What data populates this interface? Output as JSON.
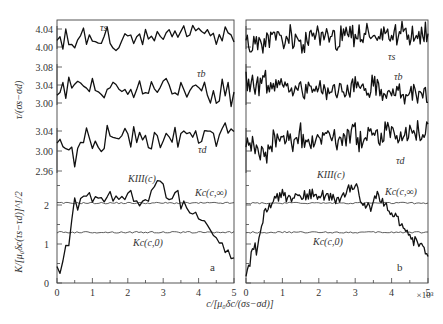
{
  "chart_data": {
    "type": "line",
    "title": "",
    "xlabel": "c/[μ0δc/(σs−σd)]",
    "x_multiplier": "×10³",
    "xticks": [
      0,
      1,
      2,
      3,
      4,
      5
    ],
    "xlim": [
      0,
      5
    ],
    "upper_ylabel": "τ/(σs−σd)",
    "lower_ylabel": "K/[μ0δc(τs−τd)]^1/2",
    "upper_subpanels": [
      {
        "name": "τs",
        "label": "τ_s",
        "yticks": [
          4.0,
          4.04
        ],
        "ylim": [
          3.98,
          4.05
        ]
      },
      {
        "name": "τb",
        "label": "τ_b",
        "yticks": [
          3.0,
          3.04,
          3.08
        ],
        "ylim": [
          2.99,
          3.09
        ]
      },
      {
        "name": "τd",
        "label": "τ_d",
        "yticks": [
          2.96,
          3.0,
          3.04
        ],
        "ylim": [
          2.96,
          3.06
        ]
      }
    ],
    "lower_yticks": [
      0,
      1,
      2
    ],
    "lower_ylim": [
      0,
      2.7
    ],
    "panels": [
      {
        "id": "a",
        "label": "a",
        "series": [
          {
            "name": "τs",
            "x": [
              0,
              0.25,
              0.5,
              0.75,
              1,
              1.25,
              1.5,
              1.75,
              2,
              2.25,
              2.5,
              2.75,
              3,
              3.25,
              3.5,
              3.75,
              4,
              4.25,
              4.5,
              4.75,
              5
            ],
            "values": [
              4.005,
              4.02,
              4.01,
              4.025,
              4.015,
              4.005,
              4.02,
              4.0,
              4.025,
              4.02,
              4.03,
              4.015,
              4.02,
              4.03,
              4.035,
              4.02,
              4.04,
              4.035,
              4.02,
              4.04,
              4.025
            ]
          },
          {
            "name": "τb",
            "x": [
              0,
              0.25,
              0.5,
              0.75,
              1,
              1.25,
              1.5,
              1.75,
              2,
              2.25,
              2.5,
              2.75,
              3,
              3.25,
              3.5,
              3.75,
              4,
              4.25,
              4.5,
              4.75,
              5
            ],
            "values": [
              3.04,
              3.035,
              3.05,
              3.03,
              3.04,
              3.025,
              3.035,
              3.03,
              3.04,
              3.03,
              3.04,
              3.025,
              3.05,
              3.03,
              3.04,
              3.02,
              3.04,
              3.03,
              3.02,
              3.025,
              3.01
            ]
          },
          {
            "name": "τd",
            "x": [
              0,
              0.25,
              0.5,
              0.75,
              1,
              1.25,
              1.5,
              1.75,
              2,
              2.25,
              2.5,
              2.75,
              3,
              3.25,
              3.5,
              3.75,
              4,
              4.25,
              4.5,
              4.75,
              5
            ],
            "values": [
              3.02,
              3.01,
              2.985,
              3.02,
              3.03,
              3.02,
              3.025,
              3.02,
              3.03,
              3.02,
              3.025,
              3.03,
              3.02,
              3.04,
              3.025,
              3.03,
              3.035,
              3.03,
              3.035,
              3.03,
              3.04
            ]
          },
          {
            "name": "K_III(c)",
            "x": [
              0,
              0.1,
              0.2,
              0.3,
              0.4,
              0.5,
              0.6,
              0.8,
              1.0,
              1.2,
              1.5,
              1.8,
              2.0,
              2.3,
              2.6,
              2.8,
              3.0,
              3.2,
              3.4,
              3.5,
              3.6,
              3.7,
              3.8,
              4.0,
              4.2,
              4.4,
              4.6,
              4.8,
              5.0
            ],
            "values": [
              0.35,
              0.1,
              0.9,
              0.8,
              1.5,
              2.1,
              1.95,
              2.25,
              2.2,
              2.15,
              2.25,
              2.2,
              2.3,
              2.1,
              2.2,
              2.5,
              2.45,
              2.0,
              2.4,
              2.0,
              2.0,
              1.95,
              1.8,
              1.6,
              1.45,
              1.2,
              1.0,
              0.8,
              0.6
            ]
          },
          {
            "name": "K_c(c,∞)",
            "x": [
              0,
              5
            ],
            "values": [
              2.05,
              2.05
            ]
          },
          {
            "name": "K_c(c,0)",
            "x": [
              0,
              5
            ],
            "values": [
              1.3,
              1.3
            ]
          }
        ]
      },
      {
        "id": "b",
        "label": "b",
        "series": [
          {
            "name": "τs",
            "x": [
              0,
              0.25,
              0.5,
              0.75,
              1,
              1.25,
              1.5,
              1.75,
              2,
              2.25,
              2.5,
              2.75,
              3,
              3.25,
              3.5,
              3.75,
              4,
              4.25,
              4.5,
              4.75,
              5
            ],
            "values": [
              4.01,
              4.02,
              4.01,
              4.025,
              4.015,
              4.02,
              4.0,
              4.03,
              4.02,
              4.025,
              4.02,
              4.03,
              4.02,
              4.035,
              4.02,
              4.03,
              4.02,
              4.035,
              4.03,
              4.025,
              4.04
            ]
          },
          {
            "name": "τb",
            "x": [
              0,
              0.25,
              0.5,
              0.75,
              1,
              1.25,
              1.5,
              1.75,
              2,
              2.25,
              2.5,
              2.75,
              3,
              3.25,
              3.5,
              3.75,
              4,
              4.25,
              4.5,
              4.75,
              5
            ],
            "values": [
              3.04,
              3.03,
              3.05,
              3.035,
              3.04,
              3.03,
              3.025,
              3.04,
              3.03,
              3.02,
              3.035,
              3.03,
              3.04,
              3.03,
              3.035,
              3.02,
              3.03,
              3.02,
              3.025,
              3.02,
              3.02
            ]
          },
          {
            "name": "τd",
            "x": [
              0,
              0.25,
              0.5,
              0.75,
              1,
              1.25,
              1.5,
              1.75,
              2,
              2.25,
              2.5,
              2.75,
              3,
              3.25,
              3.5,
              3.75,
              4,
              4.25,
              4.5,
              4.75,
              5
            ],
            "values": [
              3.02,
              3.0,
              2.99,
              3.02,
              3.025,
              3.02,
              3.03,
              3.02,
              3.025,
              3.03,
              3.02,
              3.025,
              3.03,
              3.02,
              3.035,
              3.03,
              3.035,
              3.03,
              3.035,
              3.04,
              3.03
            ]
          },
          {
            "name": "K_III(c)",
            "x": [
              0,
              0.1,
              0.2,
              0.3,
              0.4,
              0.5,
              0.6,
              0.8,
              1.0,
              1.2,
              1.5,
              1.8,
              2.0,
              2.3,
              2.6,
              2.8,
              3.0,
              3.2,
              3.4,
              3.5,
              3.6,
              3.7,
              3.8,
              4.0,
              4.2,
              4.4,
              4.6,
              4.8,
              5.0
            ],
            "values": [
              0.2,
              0.5,
              1.0,
              0.8,
              1.4,
              1.75,
              2.0,
              2.15,
              2.3,
              2.15,
              2.2,
              2.3,
              2.25,
              2.2,
              2.1,
              2.4,
              2.5,
              2.1,
              1.9,
              2.1,
              2.3,
              2.2,
              2.0,
              1.8,
              1.6,
              1.4,
              1.1,
              0.9,
              0.7
            ]
          },
          {
            "name": "K_c(c,∞)",
            "x": [
              0,
              5
            ],
            "values": [
              2.05,
              2.05
            ]
          },
          {
            "name": "K_c(c,0)",
            "x": [
              0,
              5
            ],
            "values": [
              1.3,
              1.3
            ]
          }
        ]
      }
    ],
    "annotations": [
      "τ_s",
      "τ_b",
      "τ_d",
      "K_III(c)",
      "K_c(c,∞)",
      "K_c(c,0)",
      "a",
      "b"
    ],
    "grid": false,
    "legend": "none (inline labels)"
  },
  "labels": {
    "xlabel_text": "c/[μ₀δc/(σs−σd)]",
    "x_multiplier": "×10³",
    "upper_ylabel": "τ/(σs−σd)",
    "lower_ylabel": "K/[μ₀δc(τs−τd)]^1/2",
    "tau_s": "τs",
    "tau_b": "τb",
    "tau_d": "τd",
    "k3": "KIII(c)",
    "kc_inf": "Kc(c,∞)",
    "kc_0": "Kc(c,0)",
    "panel_a": "a",
    "panel_b": "b"
  }
}
